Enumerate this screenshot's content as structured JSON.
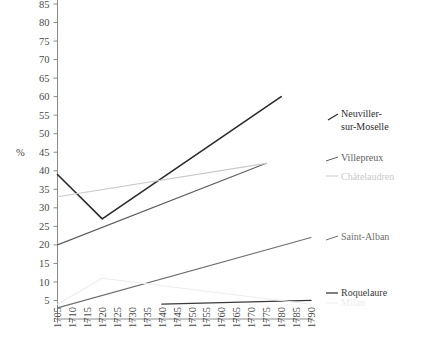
{
  "chart_data": {
    "type": "line",
    "title": "",
    "xlabel": "",
    "ylabel": "%",
    "ylim": [
      0,
      88
    ],
    "xlim": [
      1705,
      1790
    ],
    "grid": false,
    "legend_position": "right-inline",
    "yticks": [
      5,
      10,
      15,
      20,
      25,
      30,
      35,
      40,
      45,
      50,
      55,
      60,
      65,
      70,
      75,
      80,
      85
    ],
    "xticks": [
      1705,
      1710,
      1715,
      1720,
      1725,
      1730,
      1735,
      1740,
      1745,
      1750,
      1755,
      1760,
      1765,
      1770,
      1775,
      1780,
      1785,
      1790
    ],
    "series": [
      {
        "name": "Neuviller-sur-Moselle",
        "color": "#2b2b2b",
        "width": 1.6,
        "label_lines": [
          "Neuviller-",
          "sur-Moselle"
        ],
        "x": [
          1705,
          1720,
          1780
        ],
        "values": [
          39,
          27,
          60
        ]
      },
      {
        "name": "Villepreux",
        "color": "#5e5e5e",
        "width": 1.1,
        "label_lines": [
          "Villepreux"
        ],
        "x": [
          1705,
          1775
        ],
        "values": [
          20,
          42
        ]
      },
      {
        "name": "Châtelaudren",
        "color": "#c9c9c9",
        "width": 1.1,
        "label_lines": [
          "Châtelaudren"
        ],
        "x": [
          1705,
          1775
        ],
        "values": [
          33,
          42
        ]
      },
      {
        "name": "Saint-Alban",
        "color": "#6f6f6f",
        "width": 1.1,
        "label_lines": [
          "Saint-Alban"
        ],
        "x": [
          1705,
          1790
        ],
        "values": [
          3,
          22
        ]
      },
      {
        "name": "Roquelaure",
        "color": "#3a3a3a",
        "width": 1.3,
        "label_lines": [
          "Roquelaure"
        ],
        "x": [
          1740,
          1790
        ],
        "values": [
          4,
          5
        ]
      },
      {
        "name": "Milan",
        "color": "#ededed",
        "width": 1.1,
        "label_lines": [
          "Milan"
        ],
        "x": [
          1705,
          1720,
          1790
        ],
        "values": [
          4,
          11,
          4
        ]
      }
    ]
  }
}
